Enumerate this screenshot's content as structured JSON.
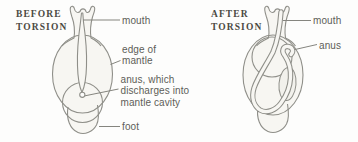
{
  "colors": {
    "outline": "#8f8f89",
    "body_fill": "#f7f6f2",
    "blob_fill": "#f2f1ec",
    "background": "#fdfdfc",
    "label_text": "#5d5d58",
    "heading_text": "#4b4942",
    "leader_line": "#85857f"
  },
  "before": {
    "heading": {
      "line1": "BEFORE",
      "line2": "TORSION"
    },
    "labels": {
      "mouth": "mouth",
      "edge_of_mantle_line1": "edge of",
      "edge_of_mantle_line2": "mantle",
      "anus_line1": "anus, which",
      "anus_line2": "discharges into",
      "anus_line3": "mantle cavity",
      "foot": "foot"
    }
  },
  "after": {
    "heading": {
      "line1": "AFTER",
      "line2": "TORSION"
    },
    "labels": {
      "mouth": "mouth",
      "anus": "anus"
    }
  }
}
